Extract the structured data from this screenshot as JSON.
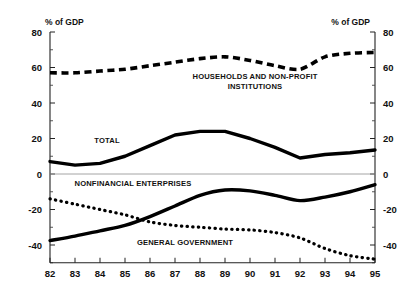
{
  "chart_data": {
    "type": "line",
    "title": "",
    "xlabel": "",
    "ylabel": "% of GDP",
    "ylabel_right": "% of GDP",
    "ylim": [
      -50,
      80
    ],
    "xlim": [
      82,
      95
    ],
    "grid": false,
    "zero_line": true,
    "legend": "inline-annotations",
    "categories": [
      "82",
      "83",
      "84",
      "85",
      "86",
      "87",
      "88",
      "89",
      "90",
      "91",
      "92",
      "93",
      "94",
      "95"
    ],
    "x": [
      82,
      83,
      84,
      85,
      86,
      87,
      88,
      89,
      90,
      91,
      92,
      93,
      94,
      95
    ],
    "yticks": [
      80,
      60,
      40,
      20,
      0,
      -20,
      -40
    ],
    "yticks_right": [
      80,
      60,
      40,
      20,
      0,
      -20,
      -40
    ],
    "yticklabels": [
      "80",
      "60",
      "40",
      "20",
      "0",
      "-20",
      "-40"
    ],
    "yticklabels_right": [
      "80",
      "60",
      "40",
      "20",
      "0",
      "-20",
      "-40"
    ],
    "series": [
      {
        "name": "HOUSEHOLDS AND NON-PROFIT INSTITUTIONS",
        "style": "dashed",
        "values": [
          57,
          57,
          58,
          59,
          61,
          63,
          65,
          66,
          64,
          61,
          59,
          66,
          68,
          68.5
        ]
      },
      {
        "name": "TOTAL",
        "style": "solid",
        "values": [
          7,
          5,
          6,
          10,
          16,
          22,
          24,
          24,
          20,
          15,
          9,
          11,
          12,
          13.5
        ]
      },
      {
        "name": "NONFINANCIAL ENTERPRISES",
        "style": "solid",
        "values": [
          -37.5,
          -35,
          -32,
          -29,
          -24,
          -18,
          -12,
          -9,
          -9.5,
          -12,
          -15,
          -13,
          -10,
          -6
        ]
      },
      {
        "name": "GENERAL GOVERNMENT",
        "style": "dotted",
        "values": [
          -14,
          -17,
          -20,
          -23,
          -27,
          -29,
          -30,
          -31,
          -31.5,
          -33,
          -36,
          -42,
          -46,
          -48
        ]
      }
    ],
    "annotations": [
      {
        "name": "households-label",
        "text_lines": [
          "HOUSEHOLDS AND NON-PROFIT",
          "INSTITUTIONS"
        ],
        "x_px": 255,
        "y_px": 79
      },
      {
        "name": "total-label",
        "text_lines": [
          "TOTAL"
        ],
        "x_px": 107,
        "y_px": 143
      },
      {
        "name": "nonfinancial-enterprises-label",
        "text_lines": [
          "NONFINANCIAL ENTERPRISES"
        ],
        "x_px": 133,
        "y_px": 186
      },
      {
        "name": "general-government-label",
        "text_lines": [
          "GENERAL GOVERNMENT"
        ],
        "x_px": 185,
        "y_px": 245
      }
    ]
  },
  "axes": {
    "left_unit_label": "% of GDP",
    "right_unit_label": "% of GDP"
  },
  "colors": {
    "ink": "#000000",
    "axis": "#222222",
    "zero_line": "#9a9a9a",
    "background": "#ffffff"
  }
}
